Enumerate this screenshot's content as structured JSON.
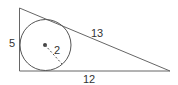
{
  "diagram": {
    "type": "right triangle with inscribed circle",
    "labels": {
      "left_side": "5",
      "hypotenuse": "13",
      "bottom_side": "12",
      "radius": "2"
    },
    "colors": {
      "stroke": "#555555",
      "text": "#333333",
      "center_dot": "#444444"
    }
  }
}
